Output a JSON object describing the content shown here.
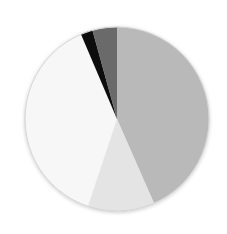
{
  "chart_data": {
    "type": "pie",
    "title": "",
    "start_angle_deg": 0,
    "direction": "clockwise",
    "legend": [],
    "slices": [
      {
        "label": "Slice 1",
        "value": 43.4,
        "color": "#b9b9b9"
      },
      {
        "label": "Slice 2",
        "value": 11.7,
        "color": "#e4e4e4"
      },
      {
        "label": "Slice 3",
        "value": 38.5,
        "color": "#f7f7f7"
      },
      {
        "label": "Slice 4",
        "value": 2.1,
        "color": "#111111"
      },
      {
        "label": "Slice 5",
        "value": 4.3,
        "color": "#6b6b6b"
      }
    ],
    "values": [
      43.4,
      11.7,
      38.5,
      2.1,
      4.3
    ],
    "categories": [
      "Slice 1",
      "Slice 2",
      "Slice 3",
      "Slice 4",
      "Slice 5"
    ],
    "center": [
      117,
      119
    ],
    "radius": 92
  }
}
